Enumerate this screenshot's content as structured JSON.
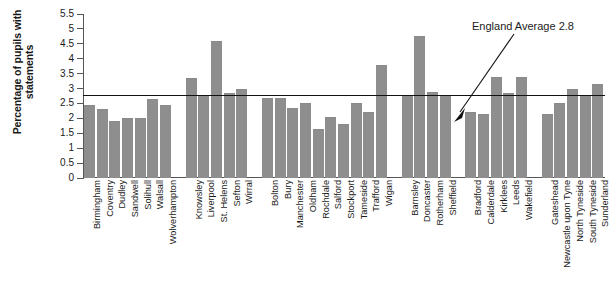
{
  "chart_data": {
    "type": "bar",
    "title": "",
    "xlabel": "",
    "ylabel": "Percentage of pupils with statements",
    "ylim": [
      0,
      5.5
    ],
    "yticks": [
      "0",
      "0.5",
      "1",
      "1.5",
      "2",
      "2.5",
      "3",
      "3.5",
      "4",
      "4.5",
      "5",
      "5.5"
    ],
    "grid": false,
    "legend": "none",
    "bar_color": "#8e8e8e",
    "annotations": [
      {
        "name": "england-average",
        "text": "England Average 2.8",
        "value": 2.8,
        "type": "reference-line"
      }
    ],
    "groups": [
      {
        "name": "west-midlands",
        "categories": [
          "Birmingham",
          "Coventry",
          "Dudley",
          "Sandwell",
          "Solihull",
          "Walsall",
          "Wolverhampton"
        ],
        "values": [
          2.45,
          2.3,
          1.9,
          2.0,
          2.0,
          2.65,
          2.45
        ]
      },
      {
        "name": "merseyside",
        "categories": [
          "Knowsley",
          "Liverpool",
          "St. Helens",
          "Sefton",
          "Wirral"
        ],
        "values": [
          3.35,
          2.8,
          4.6,
          2.85,
          3.0
        ]
      },
      {
        "name": "greater-manchester",
        "categories": [
          "Bolton",
          "Bury",
          "Manchester",
          "Oldham",
          "Rochdale",
          "Salford",
          "Stockport",
          "Tameside",
          "Trafford",
          "Wigan"
        ],
        "values": [
          2.7,
          2.7,
          2.35,
          2.5,
          1.65,
          2.05,
          1.8,
          2.5,
          2.2,
          3.8
        ]
      },
      {
        "name": "south-yorkshire",
        "categories": [
          "Barnsley",
          "Doncaster",
          "Rotherham",
          "Sheffield"
        ],
        "values": [
          2.8,
          4.75,
          2.9,
          2.8
        ]
      },
      {
        "name": "west-yorkshire",
        "categories": [
          "Bradford",
          "Calderdale",
          "Kirklees",
          "Leeds",
          "Wakefield"
        ],
        "values": [
          2.2,
          2.15,
          3.4,
          2.85,
          3.4
        ]
      },
      {
        "name": "tyne-and-wear",
        "categories": [
          "Gateshead",
          "Newcastle upon Tyne",
          "North Tyneside",
          "South Tyneside",
          "Sunderland"
        ],
        "values": [
          2.15,
          2.5,
          3.0,
          2.8,
          3.15
        ]
      }
    ]
  },
  "axis": {
    "y_title_line1": "Percentage of pupils with",
    "y_title_line2": "statements"
  }
}
